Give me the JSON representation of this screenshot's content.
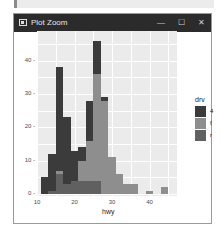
{
  "window": {
    "title": "Plot Zoom",
    "controls": {
      "minimize": "—",
      "maximize": "☐",
      "close": "✕"
    }
  },
  "chart_data": {
    "type": "bar",
    "stacked": true,
    "title": "",
    "xlabel": "hwy",
    "ylabel": "",
    "xlim": [
      10,
      46
    ],
    "ylim": [
      0,
      48
    ],
    "x_ticks": [
      "10",
      "20",
      "30",
      "40"
    ],
    "y_ticks": [
      "0",
      "10",
      "20",
      "30",
      "40"
    ],
    "grid": true,
    "legend": {
      "title": "drv",
      "position": "right",
      "entries": [
        "4",
        "f",
        "r"
      ]
    },
    "bin_width": 2,
    "categories": [
      12,
      14,
      16,
      18,
      20,
      22,
      24,
      26,
      28,
      30,
      32,
      34,
      36,
      38,
      40,
      42,
      44
    ],
    "series": [
      {
        "name": "4",
        "color": "#3b3b3b",
        "values": [
          5,
          11,
          31,
          20,
          9,
          4,
          12,
          10,
          1,
          0,
          0,
          0,
          0,
          0,
          0,
          0,
          0
        ]
      },
      {
        "name": "f",
        "color": "#8e8e8e",
        "values": [
          0,
          0,
          1,
          0,
          0,
          6,
          12,
          32,
          28,
          11,
          6,
          3,
          3,
          0,
          1,
          0,
          2
        ]
      },
      {
        "name": "r",
        "color": "#606060",
        "values": [
          0,
          1,
          6,
          3,
          4,
          4,
          4,
          4,
          0,
          0,
          0,
          0,
          0,
          0,
          0,
          0,
          0
        ]
      }
    ]
  }
}
